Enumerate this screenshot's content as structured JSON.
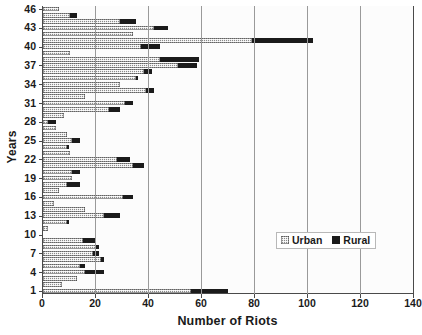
{
  "chart_data": {
    "type": "bar",
    "orientation": "horizontal",
    "stacked": true,
    "title": "",
    "xlabel": "Number of Riots",
    "ylabel": "Years",
    "xlim": [
      0,
      140
    ],
    "ylim": [
      0,
      47
    ],
    "xticks": [
      0,
      20,
      40,
      60,
      80,
      100,
      120,
      140
    ],
    "yticks": [
      1,
      4,
      7,
      10,
      13,
      16,
      19,
      22,
      25,
      28,
      31,
      34,
      37,
      40,
      43,
      46
    ],
    "grid": "vertical",
    "legend_position": "inside-right-lower",
    "categories": [
      1,
      2,
      3,
      4,
      5,
      6,
      7,
      8,
      9,
      10,
      11,
      12,
      13,
      14,
      15,
      16,
      17,
      18,
      19,
      20,
      21,
      22,
      23,
      24,
      25,
      26,
      27,
      28,
      29,
      30,
      31,
      32,
      33,
      34,
      35,
      36,
      37,
      38,
      39,
      40,
      41,
      42,
      43,
      44,
      45,
      46
    ],
    "series": [
      {
        "name": "Urban",
        "color": "#8a8a8a",
        "pattern": "checker",
        "values": [
          56,
          7,
          13,
          16,
          14,
          22,
          19,
          20,
          15,
          0,
          2,
          9,
          23,
          16,
          4,
          30,
          6,
          9,
          11,
          11,
          34,
          28,
          10,
          9,
          11,
          9,
          5,
          2,
          8,
          25,
          31,
          16,
          39,
          29,
          35,
          38,
          51,
          44,
          10,
          37,
          79,
          34,
          42,
          29,
          10,
          6
        ]
      },
      {
        "name": "Rural",
        "color": "#1b1b1b",
        "pattern": "solid",
        "values": [
          14,
          0,
          0,
          7,
          2,
          1,
          2,
          1,
          5,
          0,
          0,
          1,
          6,
          0,
          0,
          4,
          0,
          5,
          0,
          3,
          4,
          5,
          0,
          1,
          3,
          0,
          0,
          3,
          0,
          4,
          3,
          0,
          3,
          0,
          1,
          3,
          7,
          15,
          0,
          7,
          23,
          0,
          5,
          6,
          3,
          0
        ]
      }
    ]
  },
  "legend": {
    "items": [
      {
        "label": "Urban",
        "swatch": "urban-swatch"
      },
      {
        "label": "Rural",
        "swatch": "rural-swatch"
      }
    ]
  },
  "axes": {
    "x_title": "Number of Riots",
    "y_title": "Years",
    "x_tick_labels": [
      "0",
      "20",
      "40",
      "60",
      "80",
      "100",
      "120",
      "140"
    ],
    "y_tick_labels": [
      "1",
      "4",
      "7",
      "10",
      "13",
      "16",
      "19",
      "22",
      "25",
      "28",
      "31",
      "34",
      "37",
      "40",
      "43",
      "46"
    ]
  }
}
